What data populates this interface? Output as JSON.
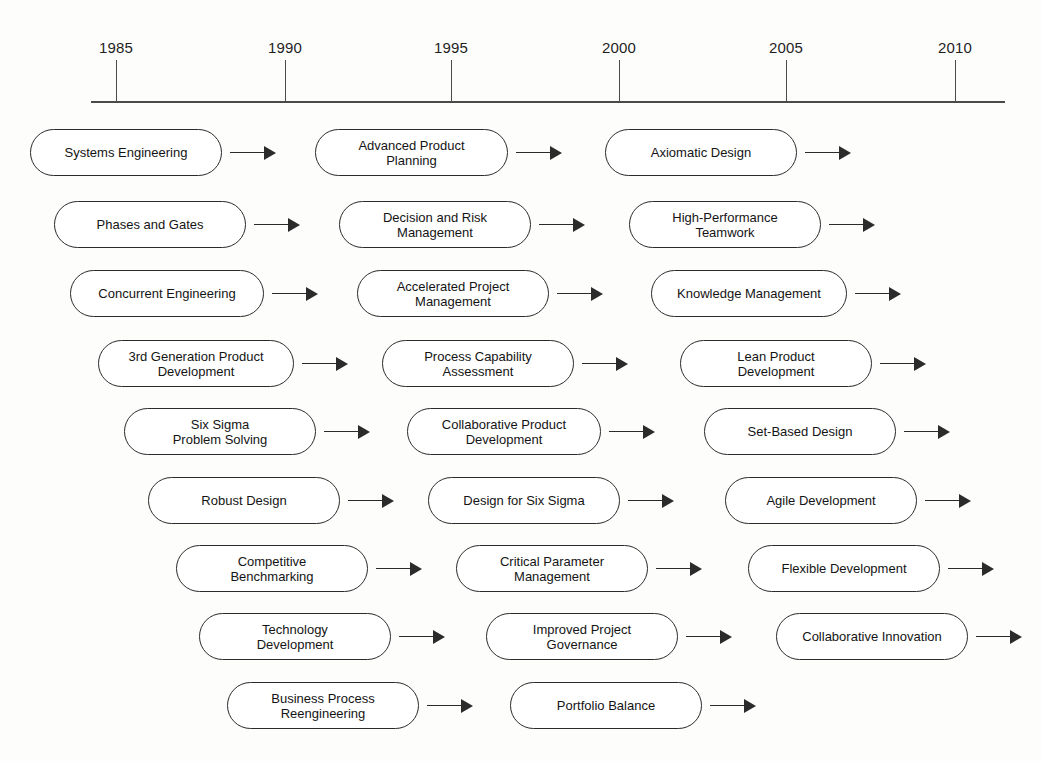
{
  "diagram": {
    "background_color": "#fdfdfc",
    "line_color": "#2b2b2b"
  },
  "axis": {
    "name": "timeline-axis",
    "start_x": 91,
    "end_x": 1005,
    "y": 101,
    "ticks": [
      {
        "label": "1985",
        "x": 116
      },
      {
        "label": "1990",
        "x": 285
      },
      {
        "label": "1995",
        "x": 451
      },
      {
        "label": "2000",
        "x": 619
      },
      {
        "label": "2005",
        "x": 786
      },
      {
        "label": "2010",
        "x": 955
      }
    ]
  },
  "rows": [
    {
      "index": 1,
      "y": 129,
      "height": 47,
      "items": [
        {
          "label": "Systems Engineering",
          "x": 30,
          "width": 192,
          "arrow_x": 230,
          "arrow_w": 46
        },
        {
          "label": "Advanced Product\nPlanning",
          "x": 315,
          "width": 193,
          "arrow_x": 516,
          "arrow_w": 46
        },
        {
          "label": "Axiomatic Design",
          "x": 605,
          "width": 192,
          "arrow_x": 805,
          "arrow_w": 46
        }
      ]
    },
    {
      "index": 2,
      "y": 201,
      "height": 47,
      "items": [
        {
          "label": "Phases and Gates",
          "x": 54,
          "width": 192,
          "arrow_x": 254,
          "arrow_w": 46
        },
        {
          "label": "Decision and Risk\nManagement",
          "x": 339,
          "width": 192,
          "arrow_x": 539,
          "arrow_w": 46
        },
        {
          "label": "High-Performance\nTeamwork",
          "x": 629,
          "width": 192,
          "arrow_x": 829,
          "arrow_w": 46
        }
      ]
    },
    {
      "index": 3,
      "y": 270,
      "height": 47,
      "items": [
        {
          "label": "Concurrent Engineering",
          "x": 70,
          "width": 194,
          "arrow_x": 272,
          "arrow_w": 46
        },
        {
          "label": "Accelerated Project\nManagement",
          "x": 357,
          "width": 192,
          "arrow_x": 557,
          "arrow_w": 46
        },
        {
          "label": "Knowledge Management",
          "x": 651,
          "width": 196,
          "arrow_x": 855,
          "arrow_w": 46
        }
      ]
    },
    {
      "index": 4,
      "y": 340,
      "height": 47,
      "items": [
        {
          "label": "3rd Generation Product\nDevelopment",
          "x": 98,
          "width": 196,
          "arrow_x": 302,
          "arrow_w": 46
        },
        {
          "label": "Process Capability\nAssessment",
          "x": 382,
          "width": 192,
          "arrow_x": 582,
          "arrow_w": 46
        },
        {
          "label": "Lean Product\nDevelopment",
          "x": 680,
          "width": 192,
          "arrow_x": 880,
          "arrow_w": 46
        }
      ]
    },
    {
      "index": 5,
      "y": 408,
      "height": 47,
      "items": [
        {
          "label": "Six Sigma\nProblem Solving",
          "x": 124,
          "width": 192,
          "arrow_x": 324,
          "arrow_w": 46
        },
        {
          "label": "Collaborative Product\nDevelopment",
          "x": 407,
          "width": 194,
          "arrow_x": 609,
          "arrow_w": 46
        },
        {
          "label": "Set-Based Design",
          "x": 704,
          "width": 192,
          "arrow_x": 904,
          "arrow_w": 46
        }
      ]
    },
    {
      "index": 6,
      "y": 477,
      "height": 47,
      "items": [
        {
          "label": "Robust Design",
          "x": 148,
          "width": 192,
          "arrow_x": 348,
          "arrow_w": 46
        },
        {
          "label": "Design for Six Sigma",
          "x": 428,
          "width": 192,
          "arrow_x": 628,
          "arrow_w": 46
        },
        {
          "label": "Agile Development",
          "x": 725,
          "width": 192,
          "arrow_x": 925,
          "arrow_w": 46
        }
      ]
    },
    {
      "index": 7,
      "y": 545,
      "height": 47,
      "items": [
        {
          "label": "Competitive\nBenchmarking",
          "x": 176,
          "width": 192,
          "arrow_x": 376,
          "arrow_w": 46
        },
        {
          "label": "Critical Parameter\nManagement",
          "x": 456,
          "width": 192,
          "arrow_x": 656,
          "arrow_w": 46
        },
        {
          "label": "Flexible Development",
          "x": 748,
          "width": 192,
          "arrow_x": 948,
          "arrow_w": 46
        }
      ]
    },
    {
      "index": 8,
      "y": 613,
      "height": 47,
      "items": [
        {
          "label": "Technology\nDevelopment",
          "x": 199,
          "width": 192,
          "arrow_x": 399,
          "arrow_w": 46
        },
        {
          "label": "Improved Project\nGovernance",
          "x": 486,
          "width": 192,
          "arrow_x": 686,
          "arrow_w": 46
        },
        {
          "label": "Collaborative Innovation",
          "x": 776,
          "width": 192,
          "arrow_x": 976,
          "arrow_w": 46
        }
      ]
    },
    {
      "index": 9,
      "y": 682,
      "height": 47,
      "items": [
        {
          "label": "Business Process\nReengineering",
          "x": 227,
          "width": 192,
          "arrow_x": 427,
          "arrow_w": 46
        },
        {
          "label": "Portfolio Balance",
          "x": 510,
          "width": 192,
          "arrow_x": 710,
          "arrow_w": 46
        }
      ]
    }
  ]
}
